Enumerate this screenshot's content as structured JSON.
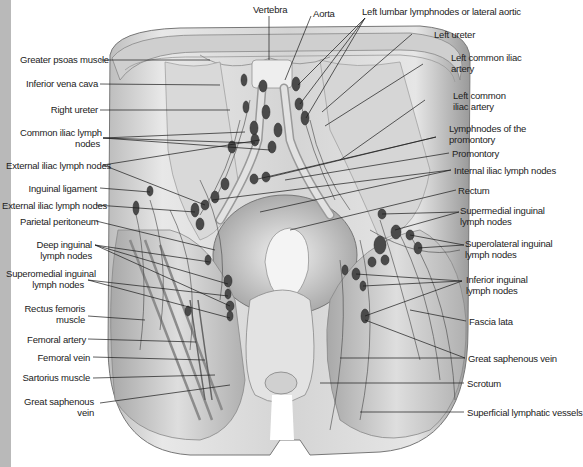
{
  "figure": {
    "labels_left": [
      {
        "id": "greater-psoas-muscle",
        "text": "Greater psoas muscle"
      },
      {
        "id": "inferior-vena-cava",
        "text": "Inferior vena cava"
      },
      {
        "id": "right-ureter",
        "text": "Right ureter"
      },
      {
        "id": "common-iliac-lymph-nodes",
        "line1": "Common iliac lymph",
        "line2": "nodes"
      },
      {
        "id": "external-iliac-lymph-nodes-1",
        "text": "External iliac lymph nodes"
      },
      {
        "id": "inguinal-ligament",
        "text": "Inguinal ligament"
      },
      {
        "id": "external-iliac-lymph-nodes-2",
        "text": "External iliac lymph nodes"
      },
      {
        "id": "parietal-peritoneum",
        "text": "Parietal peritoneum"
      },
      {
        "id": "deep-inguinal-lymph-nodes",
        "line1": "Deep inguinal",
        "line2": "lymph nodes"
      },
      {
        "id": "superomedial-inguinal-lymph-nodes-left",
        "line1": "Superomedial inguinal",
        "line2": "lymph nodes"
      },
      {
        "id": "rectus-femoris-muscle",
        "line1": "Rectus femoris",
        "line2": "muscle"
      },
      {
        "id": "femoral-artery",
        "text": "Femoral artery"
      },
      {
        "id": "femoral-vein",
        "text": "Femoral vein"
      },
      {
        "id": "sartorius-muscle",
        "text": "Sartorius muscle"
      },
      {
        "id": "great-saphenous-vein-left",
        "line1": "Great saphenous",
        "line2": "vein"
      }
    ],
    "labels_top": [
      {
        "id": "vertebra",
        "text": "Vertebra"
      },
      {
        "id": "aorta",
        "text": "Aorta"
      },
      {
        "id": "left-lumbar-lymphnodes",
        "text": "Left lumbar lymphnodes or lateral aortic"
      }
    ],
    "labels_right": [
      {
        "id": "left-ureter",
        "text": "Left ureter"
      },
      {
        "id": "left-common-iliac-artery-1",
        "line1": "Left common iliac",
        "line2": "artery"
      },
      {
        "id": "left-common-iliac-artery-2",
        "line1": "Left common",
        "line2": "iliac artery"
      },
      {
        "id": "lymphnodes-of-the-promontory",
        "line1": "Lymphnodes of the",
        "line2": "promontory"
      },
      {
        "id": "promontory",
        "text": "Promontory"
      },
      {
        "id": "internal-iliac-lymph-nodes",
        "text": "Internal iliac lymph nodes"
      },
      {
        "id": "rectum",
        "text": "Rectum"
      },
      {
        "id": "supermedial-inguinal-lymph-nodes",
        "line1": "Supermedial inguinal",
        "line2": "lymph nodes"
      },
      {
        "id": "superolateral-inguinal-lymph-nodes",
        "line1": "Superolateral inguinal",
        "line2": "lymph nodes"
      },
      {
        "id": "inferior-inguinal-lymph-nodes",
        "line1": "Inferior inguinal",
        "line2": "lymph nodes"
      },
      {
        "id": "fascia-lata",
        "text": "Fascia lata"
      },
      {
        "id": "great-saphenous-vein-right",
        "text": "Great saphenous vein"
      },
      {
        "id": "scrotum",
        "text": "Scrotum"
      },
      {
        "id": "superficial-lymphatic-vessels",
        "text": "Superficial lymphatic vessels"
      }
    ]
  },
  "colors": {
    "background": "#ffffff",
    "left_strip": "#b9b9b9",
    "label_text": "#222222",
    "leader_line": "#1a1a1a",
    "tissue_light": "#e6e6e6",
    "tissue_mid": "#c4c4c4",
    "tissue_dark": "#8a8a8a",
    "lymph_node": "#4a4a4a"
  }
}
